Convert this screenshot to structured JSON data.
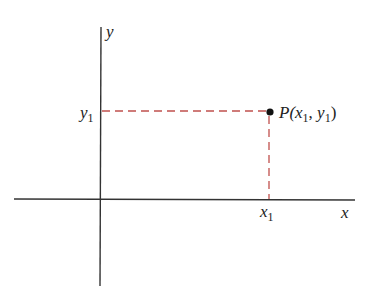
{
  "diagram": {
    "type": "cartesian-point-coordinates",
    "axes": {
      "x_label": "x",
      "y_label": "y",
      "axis_color": "#333333"
    },
    "point": {
      "name": "P",
      "label_open": "P(",
      "x_var": "x",
      "x_sub": "1",
      "sep": ", ",
      "y_var": "y",
      "y_sub": "1",
      "label_close": ")",
      "color": "#111111"
    },
    "ticks": {
      "x_tick_var": "x",
      "x_tick_sub": "1",
      "y_tick_var": "y",
      "y_tick_sub": "1"
    },
    "projection_lines": {
      "style": "dashed",
      "color": "#c0504d"
    }
  }
}
